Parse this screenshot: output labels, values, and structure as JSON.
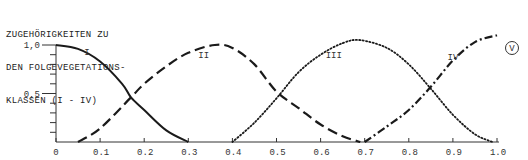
{
  "chart_data": {
    "type": "line",
    "title_lines": [
      "ZUGEHÖRIGKEITEN ZU",
      "DEN FOLGEVEGETATIONS-",
      "KLASSEN (I - IV)"
    ],
    "xlabel": "",
    "ylabel": "",
    "xlim": [
      0,
      1.0
    ],
    "ylim": [
      0,
      1.0
    ],
    "x_ticks": [
      "0",
      "0.1",
      "0.2",
      "0.3",
      "0.4",
      "0.5",
      "0.6",
      "0.7",
      "0.8",
      "0.9",
      "1.0"
    ],
    "y_ticks": [
      "1,0",
      "0,5"
    ],
    "grid": false,
    "legend": "inline labels",
    "annotation": "V",
    "series": [
      {
        "name": "I",
        "style": "solid",
        "x": [
          0,
          0.05,
          0.1,
          0.15,
          0.17,
          0.2,
          0.25,
          0.3
        ],
        "y": [
          1.0,
          0.96,
          0.83,
          0.6,
          0.46,
          0.33,
          0.12,
          0.0
        ]
      },
      {
        "name": "II",
        "style": "dashed",
        "x": [
          0.05,
          0.1,
          0.17,
          0.2,
          0.25,
          0.3,
          0.36,
          0.4,
          0.45,
          0.5,
          0.55,
          0.6,
          0.65,
          0.69
        ],
        "y": [
          0.0,
          0.14,
          0.46,
          0.6,
          0.78,
          0.92,
          1.0,
          0.97,
          0.8,
          0.52,
          0.35,
          0.18,
          0.06,
          0.0
        ]
      },
      {
        "name": "III",
        "style": "dotted",
        "x": [
          0.4,
          0.45,
          0.5,
          0.55,
          0.6,
          0.65,
          0.69,
          0.75,
          0.8,
          0.85,
          0.9,
          0.95,
          0.99
        ],
        "y": [
          0.0,
          0.2,
          0.45,
          0.72,
          0.9,
          1.02,
          1.05,
          0.97,
          0.8,
          0.55,
          0.28,
          0.08,
          0.0
        ]
      },
      {
        "name": "IV",
        "style": "dash-dot",
        "x": [
          0.7,
          0.75,
          0.8,
          0.85,
          0.9,
          0.95,
          1.0
        ],
        "y": [
          0.0,
          0.16,
          0.33,
          0.57,
          0.84,
          1.03,
          1.1
        ]
      }
    ]
  }
}
